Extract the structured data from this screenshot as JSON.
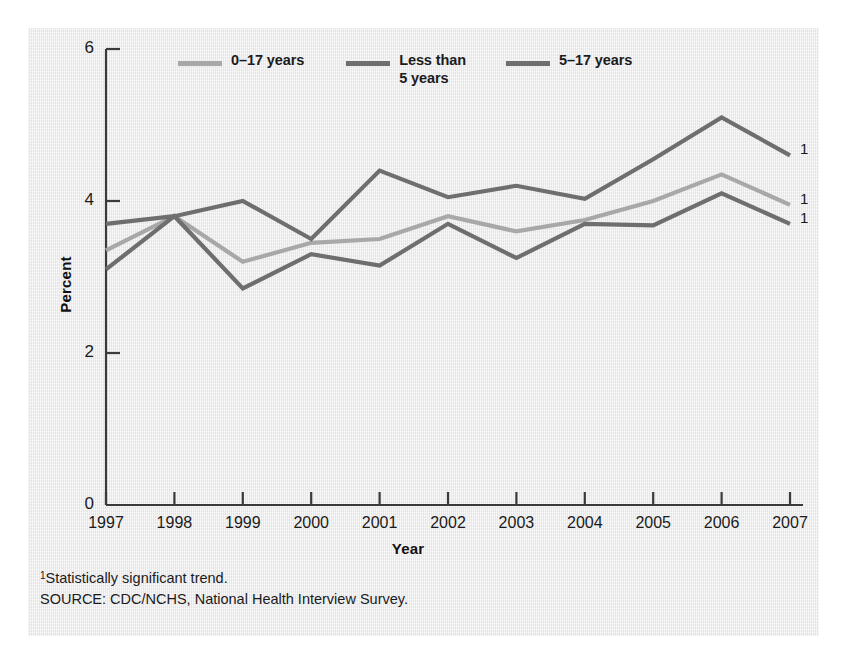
{
  "chart_data": {
    "type": "line",
    "title": "",
    "xlabel": "Year",
    "ylabel": "Percent",
    "categories": [
      "1997",
      "1998",
      "1999",
      "2000",
      "2001",
      "2002",
      "2003",
      "2004",
      "2005",
      "2006",
      "2007"
    ],
    "x": [
      1997,
      1998,
      1999,
      2000,
      2001,
      2002,
      2003,
      2004,
      2005,
      2006,
      2007
    ],
    "ylim": [
      0,
      6
    ],
    "yticks": [
      "0",
      "2",
      "4",
      "6"
    ],
    "ytick_values": [
      0,
      2,
      4,
      6
    ],
    "grid": false,
    "legend_position": "top",
    "series": [
      {
        "name": "0–17 years",
        "color": "#a8a8a8",
        "values": [
          3.35,
          3.8,
          3.2,
          3.45,
          3.5,
          3.8,
          3.6,
          3.75,
          4.0,
          4.35,
          3.95
        ],
        "end_marker": "1"
      },
      {
        "name": "Less than\n5 years",
        "color": "#6e6e6e",
        "values": [
          3.1,
          3.8,
          2.85,
          3.3,
          3.15,
          3.7,
          3.25,
          3.7,
          3.68,
          4.1,
          3.7
        ],
        "end_marker": "1"
      },
      {
        "name": "5–17 years",
        "color": "#6e6e6e",
        "values": [
          3.7,
          3.8,
          4.0,
          3.5,
          4.4,
          4.05,
          4.2,
          4.03,
          4.55,
          5.1,
          4.6
        ],
        "end_marker": "1"
      }
    ],
    "annotations": [
      "1",
      "1",
      "1"
    ]
  },
  "footnotes": {
    "footnote_marker": "1",
    "footnote_text": "Statistically significant trend.",
    "source": "SOURCE: CDC/NCHS, National Health Interview Survey."
  }
}
